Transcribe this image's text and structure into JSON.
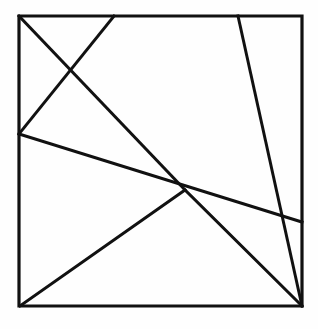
{
  "figure": {
    "background_color": "#fefefe",
    "stroke_color": "#111111",
    "frame": {
      "name": "outer-square",
      "stroke_width": 3.2,
      "left": 19,
      "top": 16,
      "right": 302,
      "bottom": 306,
      "width": 283,
      "height": 290,
      "points": "19,16 302,16 302,306 19,306 19,16"
    },
    "vertices": {
      "top_left_corner": [
        19,
        16
      ],
      "top_right_corner": [
        302,
        16
      ],
      "bottom_left_corner": [
        20,
        306
      ],
      "bottom_right_corner": [
        302,
        306
      ],
      "top_edge_point_a": [
        114,
        16
      ],
      "top_edge_point_b": [
        238,
        16
      ],
      "left_edge_point": [
        19,
        134
      ],
      "right_edge_point": [
        302,
        222
      ],
      "central_hub": [
        185,
        190
      ],
      "upper_left_crossing": [
        71,
        79
      ],
      "right_crossing": [
        289,
        216
      ]
    },
    "lines": [
      {
        "name": "line-topleft-to-hub",
        "label": "Top-left corner to central hub",
        "from": [
          19,
          16
        ],
        "to": [
          185,
          190
        ],
        "stroke_width": 3.0
      },
      {
        "name": "line-topedge-to-leftedge",
        "label": "Top edge point to left edge point",
        "from": [
          114,
          16
        ],
        "to": [
          19,
          134
        ],
        "stroke_width": 3.0
      },
      {
        "name": "line-leftedge-to-rightedge",
        "label": "Left edge point through hub to right edge point",
        "from": [
          19,
          134
        ],
        "to": [
          302,
          222
        ],
        "stroke_width": 3.0
      },
      {
        "name": "line-topedge-to-bottomright",
        "label": "Top edge point to bottom-right corner",
        "from": [
          238,
          16
        ],
        "to": [
          302,
          306
        ],
        "stroke_width": 3.0
      },
      {
        "name": "line-bottomleft-to-hub-to-bottomright",
        "label": "Bottom-left corner through hub to bottom-right corner",
        "points": "20,306 185,190 302,306",
        "stroke_width": 3.0
      }
    ]
  }
}
